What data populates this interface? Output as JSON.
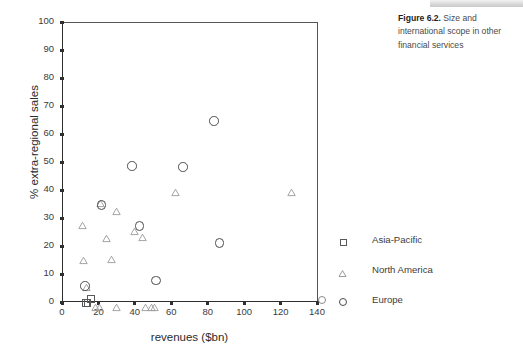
{
  "caption": {
    "figure_number": "Figure 6.2.",
    "text": " Size and international scope in other financial services"
  },
  "legend": {
    "position": "right",
    "items": [
      {
        "label": "Asia-Pacific",
        "marker": "square-marker"
      },
      {
        "label": "North America",
        "marker": "triangle-marker"
      },
      {
        "label": "Europe",
        "marker": "circle-marker"
      }
    ]
  },
  "chart_data": {
    "type": "scatter",
    "title": "",
    "xlabel": "revenues ($bn)",
    "ylabel": "% extra-regional sales",
    "xlim": [
      0,
      140
    ],
    "ylim": [
      0,
      100
    ],
    "xticks": [
      0,
      20,
      40,
      60,
      80,
      100,
      120,
      140
    ],
    "yticks": [
      0,
      10,
      20,
      30,
      40,
      50,
      60,
      70,
      80,
      90,
      100
    ],
    "grid": false,
    "legend_position": "right",
    "series": [
      {
        "name": "Asia-Pacific",
        "marker": "square",
        "color": "#595959",
        "points": [
          [
            12.5,
            0
          ],
          [
            13.5,
            0
          ],
          [
            15.5,
            1.5
          ]
        ]
      },
      {
        "name": "North America",
        "marker": "triangle",
        "color": "#9a9a9a",
        "points": [
          [
            11.0,
            29.0
          ],
          [
            12.0,
            16.5
          ],
          [
            13.5,
            7.0
          ],
          [
            21.0,
            37.0
          ],
          [
            24.5,
            24.5
          ],
          [
            27.0,
            17.0
          ],
          [
            30.0,
            34.0
          ],
          [
            40.0,
            27.0
          ],
          [
            44.0,
            25.0
          ],
          [
            62.5,
            41.0
          ],
          [
            126.0,
            41.0
          ],
          [
            18.5,
            0
          ],
          [
            20.5,
            0
          ],
          [
            30.0,
            0
          ],
          [
            46.0,
            0
          ],
          [
            49.0,
            0
          ],
          [
            51.0,
            0
          ]
        ]
      },
      {
        "name": "Europe",
        "marker": "circle",
        "color": "#4c4c4c",
        "points": [
          [
            12.0,
            6.0
          ],
          [
            21.0,
            35.0
          ],
          [
            38.0,
            49.0
          ],
          [
            42.0,
            27.5
          ],
          [
            51.0,
            8.0
          ],
          [
            66.0,
            48.5
          ],
          [
            83.0,
            65.0
          ],
          [
            86.0,
            21.5
          ]
        ]
      }
    ]
  }
}
